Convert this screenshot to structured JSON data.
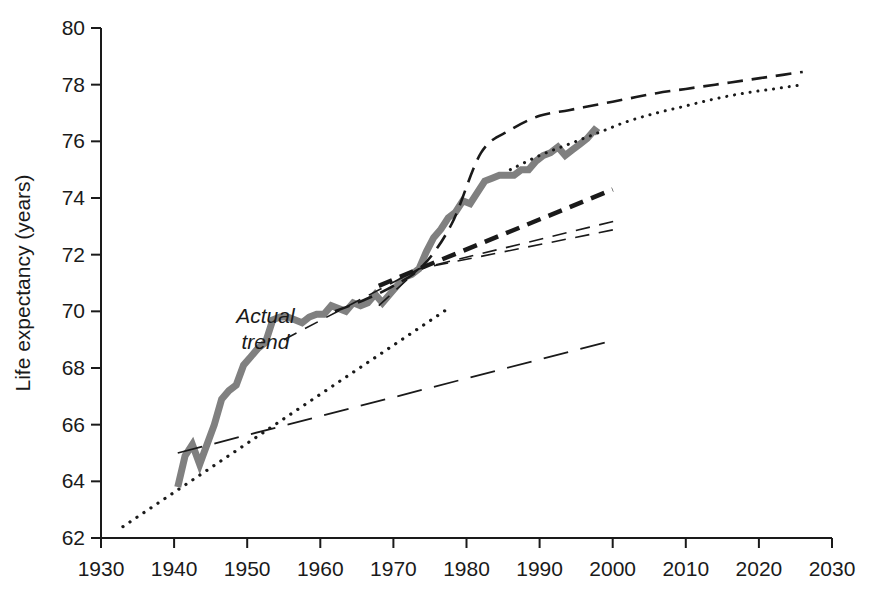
{
  "chart_data": {
    "type": "line",
    "title": "",
    "xlabel": "",
    "ylabel": "Life expectancy (years)",
    "xlim": [
      1930,
      2030
    ],
    "ylim": [
      62,
      80
    ],
    "xticks": [
      1930,
      1940,
      1950,
      1960,
      1970,
      1980,
      1990,
      2000,
      2010,
      2020,
      2030
    ],
    "yticks": [
      62,
      64,
      66,
      68,
      70,
      72,
      74,
      76,
      78,
      80
    ],
    "grid": false,
    "legend_position": "none",
    "annotations": [
      {
        "text": "Actual trend",
        "text_line1": "Actual",
        "text_line2": "trend",
        "x": 1952.5,
        "y": 69.6,
        "style": "italic"
      }
    ],
    "series": [
      {
        "name": "Actual trend",
        "style": "solid-thick-gray",
        "color": "#808080",
        "width": 7,
        "x": [
          1940.5,
          1941.5,
          1942.5,
          1943.5,
          1944.5,
          1945.5,
          1946.5,
          1947.5,
          1948.5,
          1949.5,
          1950.5,
          1951.5,
          1952.5,
          1953.5,
          1954.5,
          1955.5,
          1956.5,
          1957.5,
          1958.5,
          1959.5,
          1960.5,
          1961.5,
          1962.5,
          1963.5,
          1964.5,
          1965.5,
          1966.5,
          1967.5,
          1968.5,
          1969.5,
          1970.5,
          1971.5,
          1972.5,
          1973.5,
          1974.5,
          1975.5,
          1976.5,
          1977.5,
          1978.5,
          1979.5,
          1980.5,
          1981.5,
          1982.5,
          1983.5,
          1984.5,
          1985.5,
          1986.5,
          1987.5,
          1988.5,
          1989.5,
          1990.5,
          1991.5,
          1992.5,
          1993.5,
          1994.5,
          1995.5,
          1996.5,
          1997.5,
          1998.0
        ],
        "y": [
          63.8,
          64.9,
          65.3,
          64.6,
          65.3,
          66.0,
          66.9,
          67.2,
          67.4,
          68.1,
          68.4,
          68.7,
          68.9,
          69.7,
          69.8,
          69.8,
          69.7,
          69.6,
          69.8,
          69.9,
          69.9,
          70.2,
          70.1,
          70.0,
          70.3,
          70.2,
          70.3,
          70.6,
          70.3,
          70.6,
          70.9,
          71.2,
          71.3,
          71.5,
          72.1,
          72.6,
          72.9,
          73.3,
          73.5,
          73.9,
          73.8,
          74.2,
          74.6,
          74.7,
          74.8,
          74.8,
          74.8,
          75.0,
          75.0,
          75.3,
          75.5,
          75.6,
          75.8,
          75.5,
          75.7,
          75.9,
          76.1,
          76.4,
          76.3
        ]
      },
      {
        "name": "Projection A (long dash, low)",
        "style": "long-dash",
        "color": "#1a1a1a",
        "width": 1.8,
        "x": [
          1940.5,
          2000.5
        ],
        "y": [
          65.0,
          69.0
        ]
      },
      {
        "name": "Projection B (dotted, steep short)",
        "style": "dotted",
        "color": "#1a1a1a",
        "width": 3.2,
        "x": [
          1933.0,
          1977.5
        ],
        "y": [
          62.4,
          70.1
        ]
      },
      {
        "name": "Projection C (thin dash, from 1955)",
        "style": "medium-dash-thin",
        "color": "#1a1a1a",
        "width": 1.6,
        "x": [
          1955.0,
          1973.5,
          2000.5
        ],
        "y": [
          69.0,
          71.5,
          72.9
        ]
      },
      {
        "name": "Projection D (thin dash, from 1973)",
        "style": "medium-dash-thin",
        "color": "#1a1a1a",
        "width": 1.6,
        "x": [
          1968.0,
          1973.5,
          2000.5
        ],
        "y": [
          70.2,
          71.5,
          73.2
        ]
      },
      {
        "name": "Projection E (heavy dash, from 1973)",
        "style": "heavy-dash",
        "color": "#1a1a1a",
        "width": 4.5,
        "x": [
          1968.0,
          1973.5,
          2000.0
        ],
        "y": [
          70.9,
          71.5,
          74.3
        ]
      },
      {
        "name": "Projection F (dash, upper curve)",
        "style": "medium-dash",
        "color": "#1a1a1a",
        "width": 2.6,
        "x": [
          1962.0,
          1966.0,
          1970.0,
          1974.0,
          1978.0,
          1982.0,
          1986.0,
          1990.0,
          1994.0,
          1998.0,
          2002.0,
          2006.0,
          2010.0,
          2014.0,
          2018.0,
          2022.0,
          2026.0
        ],
        "y": [
          70.0,
          70.4,
          70.9,
          71.6,
          73.1,
          75.6,
          76.4,
          76.9,
          77.1,
          77.3,
          77.5,
          77.7,
          77.85,
          78.0,
          78.15,
          78.3,
          78.45
        ]
      },
      {
        "name": "Projection G (dotted, upper curve)",
        "style": "dotted",
        "color": "#1a1a1a",
        "width": 3.0,
        "x": [
          1986.0,
          1990.0,
          1994.0,
          1998.0,
          2002.0,
          2006.0,
          2010.0,
          2014.0,
          2018.0,
          2022.0,
          2026.0
        ],
        "y": [
          75.0,
          75.5,
          75.9,
          76.3,
          76.7,
          77.0,
          77.25,
          77.5,
          77.7,
          77.85,
          78.0
        ]
      }
    ]
  }
}
